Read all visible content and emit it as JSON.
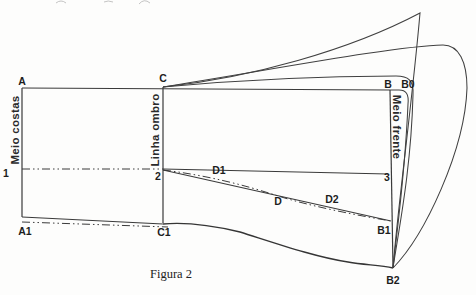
{
  "diagram": {
    "caption": "Figura 2",
    "points": {
      "A": "A",
      "C": "C",
      "B": "B",
      "B0": "B0",
      "n1": "1",
      "n2": "2",
      "n3": "3",
      "A1": "A1",
      "C1": "C1",
      "B1": "B1",
      "B2": "B2",
      "D1": "D1",
      "D": "D",
      "D2": "D2"
    },
    "guide_lines": {
      "left_label": "Meio costas",
      "middle_label": "Linha ombro",
      "right_label": "Meio frente"
    },
    "colors": {
      "line": "#3a3a3a",
      "background": "#fdfdfc",
      "label": "#1d1d1d"
    }
  }
}
